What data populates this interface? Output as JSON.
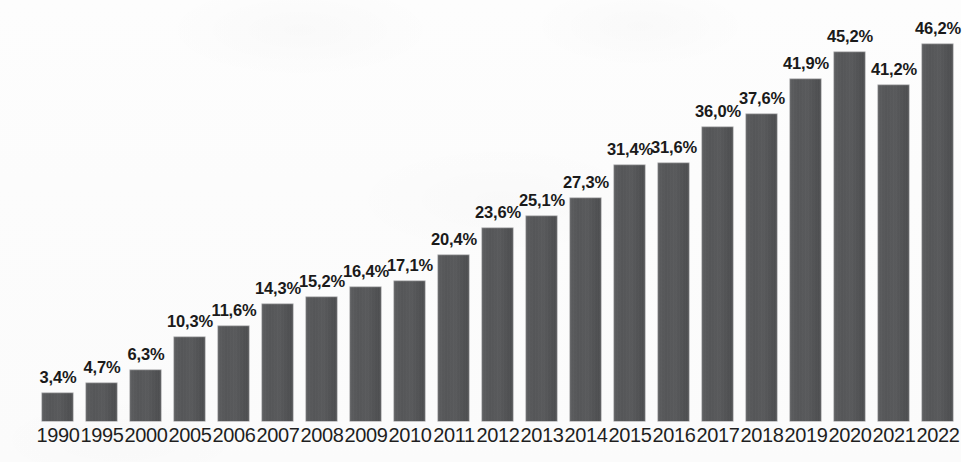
{
  "chart_data": {
    "type": "bar",
    "title": "",
    "subtitle": "",
    "xlabel": "",
    "ylabel": "",
    "ylim": [
      0,
      46.2
    ],
    "grid": false,
    "legend": null,
    "axis_visible": false,
    "value_label_suffix": "%",
    "decimal_separator": ",",
    "categories": [
      "1990",
      "1995",
      "2000",
      "2005",
      "2006",
      "2007",
      "2008",
      "2009",
      "2010",
      "2011",
      "2012",
      "2013",
      "2014",
      "2015",
      "2016",
      "2017",
      "2018",
      "2019",
      "2020",
      "2021",
      "2022"
    ],
    "values": [
      3.4,
      4.7,
      6.3,
      10.3,
      11.6,
      14.3,
      15.2,
      16.4,
      17.1,
      20.4,
      23.6,
      25.1,
      27.3,
      31.4,
      31.6,
      36.0,
      37.6,
      41.9,
      45.2,
      41.2,
      46.2
    ],
    "value_labels": [
      "3,4%",
      "4,7%",
      "6,3%",
      "10,3%",
      "11,6%",
      "14,3%",
      "15,2%",
      "16,4%",
      "17,1%",
      "20,4%",
      "23,6%",
      "25,1%",
      "27,3%",
      "31,4%",
      "31,6%",
      "36,0%",
      "37,6%",
      "41,9%",
      "45,2%",
      "41,2%",
      "46,2%"
    ],
    "colors": {
      "bar_fill": "#57585a",
      "bar_edge": "#464749",
      "value_label": "#1a1a1a",
      "year_label": "#1f1f1f",
      "background": "#fcfcfc"
    }
  }
}
